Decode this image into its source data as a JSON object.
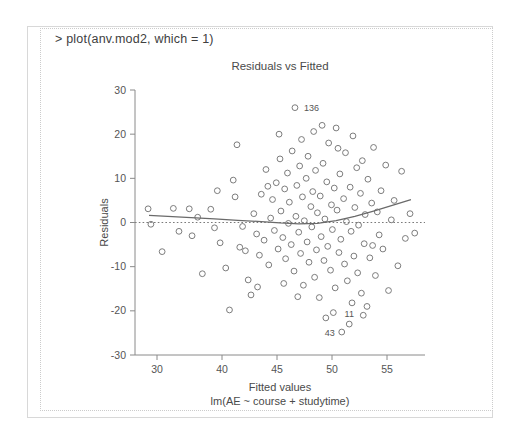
{
  "console": {
    "prompt_line": "> plot(anv.mod2, which = 1)"
  },
  "chart_data": {
    "type": "scatter",
    "title": "Residuals vs Fitted",
    "xlabel": "Fitted values",
    "sublabel": "lm(AE ~ course + studytime)",
    "ylabel": "Residuals",
    "xlim": [
      27.5,
      58.5
    ],
    "ylim": [
      -30,
      30
    ],
    "xticks": [
      30,
      40,
      45,
      50,
      55
    ],
    "xtick_labels": [
      "30",
      "40",
      "45",
      "50",
      "55"
    ],
    "yticks": [
      30,
      20,
      10,
      0,
      -10,
      -20,
      -30
    ],
    "ytick_labels": [
      "30",
      "20",
      "10",
      "0",
      "-10",
      "-20",
      "-30"
    ],
    "grid": false,
    "legend": "none",
    "reference_line": {
      "type": "horizontal-dotted",
      "y": 0
    },
    "smoother": {
      "type": "loess",
      "x": [
        29.0,
        31.0,
        33.5,
        36.0,
        38.5,
        41.0,
        43.0,
        45.0,
        47.0,
        49.0,
        51.0,
        53.0,
        55.0,
        57.0
      ],
      "y": [
        1.6,
        1.4,
        1.1,
        0.8,
        0.5,
        0.2,
        -0.1,
        -0.3,
        -0.2,
        0.4,
        1.4,
        2.6,
        3.9,
        5.2
      ]
    },
    "annotations": [
      {
        "label": "136",
        "x": 44.6,
        "y": 26.0
      },
      {
        "label": "11",
        "x": 50.4,
        "y": -23.0
      },
      {
        "label": "43",
        "x": 49.6,
        "y": -24.8
      }
    ],
    "points": [
      {
        "x": 28.9,
        "y": 3.1
      },
      {
        "x": 29.2,
        "y": -0.4
      },
      {
        "x": 30.4,
        "y": -6.6
      },
      {
        "x": 31.6,
        "y": 3.2
      },
      {
        "x": 33.3,
        "y": 3.1
      },
      {
        "x": 33.6,
        "y": -3.0
      },
      {
        "x": 34.7,
        "y": -11.6
      },
      {
        "x": 35.6,
        "y": 3.0
      },
      {
        "x": 36.0,
        "y": -1.2
      },
      {
        "x": 36.6,
        "y": -4.6
      },
      {
        "x": 37.2,
        "y": -10.3
      },
      {
        "x": 37.6,
        "y": -19.8
      },
      {
        "x": 38.0,
        "y": 9.6
      },
      {
        "x": 38.4,
        "y": 17.6
      },
      {
        "x": 38.7,
        "y": -5.6
      },
      {
        "x": 39.0,
        "y": -0.9
      },
      {
        "x": 39.3,
        "y": -6.4
      },
      {
        "x": 39.6,
        "y": -13.0
      },
      {
        "x": 39.9,
        "y": -16.4
      },
      {
        "x": 40.2,
        "y": 2.0
      },
      {
        "x": 40.5,
        "y": -2.6
      },
      {
        "x": 40.8,
        "y": -7.4
      },
      {
        "x": 41.0,
        "y": 6.4
      },
      {
        "x": 41.3,
        "y": -4.0
      },
      {
        "x": 41.5,
        "y": 12.0
      },
      {
        "x": 41.8,
        "y": -9.6
      },
      {
        "x": 42.0,
        "y": 1.0
      },
      {
        "x": 42.2,
        "y": 5.2
      },
      {
        "x": 42.4,
        "y": -1.8
      },
      {
        "x": 42.6,
        "y": 9.0
      },
      {
        "x": 42.8,
        "y": -6.0
      },
      {
        "x": 43.0,
        "y": 14.4
      },
      {
        "x": 43.1,
        "y": 2.6
      },
      {
        "x": 43.3,
        "y": -3.4
      },
      {
        "x": 43.5,
        "y": 7.6
      },
      {
        "x": 43.6,
        "y": -8.2
      },
      {
        "x": 43.8,
        "y": 11.2
      },
      {
        "x": 43.9,
        "y": -0.2
      },
      {
        "x": 44.0,
        "y": 4.6
      },
      {
        "x": 44.2,
        "y": -5.0
      },
      {
        "x": 44.3,
        "y": 16.2
      },
      {
        "x": 44.5,
        "y": -11.0
      },
      {
        "x": 44.6,
        "y": 26.0
      },
      {
        "x": 44.7,
        "y": 1.4
      },
      {
        "x": 44.8,
        "y": 8.4
      },
      {
        "x": 45.0,
        "y": -2.2
      },
      {
        "x": 45.1,
        "y": 12.8
      },
      {
        "x": 45.2,
        "y": -7.0
      },
      {
        "x": 45.4,
        "y": 5.8
      },
      {
        "x": 45.5,
        "y": -14.2
      },
      {
        "x": 45.6,
        "y": 0.4
      },
      {
        "x": 45.8,
        "y": 10.0
      },
      {
        "x": 45.9,
        "y": -4.4
      },
      {
        "x": 46.0,
        "y": 15.0
      },
      {
        "x": 46.1,
        "y": -9.0
      },
      {
        "x": 46.3,
        "y": 3.6
      },
      {
        "x": 46.4,
        "y": -1.0
      },
      {
        "x": 46.5,
        "y": 7.0
      },
      {
        "x": 46.7,
        "y": -12.4
      },
      {
        "x": 46.8,
        "y": 11.8
      },
      {
        "x": 46.9,
        "y": -6.2
      },
      {
        "x": 47.0,
        "y": 2.2
      },
      {
        "x": 47.2,
        "y": -17.0
      },
      {
        "x": 47.3,
        "y": 6.0
      },
      {
        "x": 47.4,
        "y": -3.2
      },
      {
        "x": 47.6,
        "y": 13.4
      },
      {
        "x": 47.7,
        "y": -8.6
      },
      {
        "x": 47.8,
        "y": 0.8
      },
      {
        "x": 48.0,
        "y": 9.2
      },
      {
        "x": 48.1,
        "y": -5.4
      },
      {
        "x": 48.2,
        "y": 18.0
      },
      {
        "x": 48.4,
        "y": -10.8
      },
      {
        "x": 48.5,
        "y": 4.0
      },
      {
        "x": 48.6,
        "y": -1.6
      },
      {
        "x": 48.8,
        "y": 7.8
      },
      {
        "x": 48.9,
        "y": -14.8
      },
      {
        "x": 49.0,
        "y": 21.4
      },
      {
        "x": 49.1,
        "y": 2.8
      },
      {
        "x": 49.3,
        "y": -6.8
      },
      {
        "x": 49.4,
        "y": 11.0
      },
      {
        "x": 49.5,
        "y": -3.8
      },
      {
        "x": 49.6,
        "y": -24.8
      },
      {
        "x": 49.8,
        "y": 5.4
      },
      {
        "x": 49.9,
        "y": -9.4
      },
      {
        "x": 50.0,
        "y": 15.8
      },
      {
        "x": 50.1,
        "y": 0.2
      },
      {
        "x": 50.2,
        "y": -13.2
      },
      {
        "x": 50.4,
        "y": -23.0
      },
      {
        "x": 50.5,
        "y": 8.0
      },
      {
        "x": 50.6,
        "y": -2.0
      },
      {
        "x": 50.8,
        "y": 19.6
      },
      {
        "x": 50.9,
        "y": -7.6
      },
      {
        "x": 51.0,
        "y": 3.4
      },
      {
        "x": 51.2,
        "y": 12.4
      },
      {
        "x": 51.3,
        "y": -11.4
      },
      {
        "x": 51.4,
        "y": -0.6
      },
      {
        "x": 51.6,
        "y": 6.6
      },
      {
        "x": 51.7,
        "y": -16.0
      },
      {
        "x": 51.8,
        "y": 14.0
      },
      {
        "x": 52.0,
        "y": -4.8
      },
      {
        "x": 52.1,
        "y": 1.8
      },
      {
        "x": 52.3,
        "y": -19.0
      },
      {
        "x": 52.4,
        "y": 9.8
      },
      {
        "x": 52.6,
        "y": -8.0
      },
      {
        "x": 52.8,
        "y": 4.4
      },
      {
        "x": 53.0,
        "y": 17.0
      },
      {
        "x": 53.2,
        "y": -12.0
      },
      {
        "x": 53.4,
        "y": 2.4
      },
      {
        "x": 53.6,
        "y": -2.8
      },
      {
        "x": 53.8,
        "y": 7.2
      },
      {
        "x": 54.0,
        "y": -6.0
      },
      {
        "x": 54.3,
        "y": 13.0
      },
      {
        "x": 54.6,
        "y": -15.4
      },
      {
        "x": 54.9,
        "y": 0.6
      },
      {
        "x": 55.2,
        "y": 5.0
      },
      {
        "x": 55.6,
        "y": -9.8
      },
      {
        "x": 56.0,
        "y": 11.6
      },
      {
        "x": 56.4,
        "y": -3.6
      },
      {
        "x": 56.9,
        "y": 2.0
      },
      {
        "x": 57.4,
        "y": -2.4
      },
      {
        "x": 42.9,
        "y": 20.0
      },
      {
        "x": 41.7,
        "y": 8.2
      },
      {
        "x": 44.9,
        "y": -16.8
      },
      {
        "x": 46.6,
        "y": 20.6
      },
      {
        "x": 48.7,
        "y": -20.4
      },
      {
        "x": 50.7,
        "y": -18.2
      },
      {
        "x": 43.4,
        "y": -13.8
      },
      {
        "x": 47.9,
        "y": -21.6
      },
      {
        "x": 45.3,
        "y": 18.8
      },
      {
        "x": 40.6,
        "y": -14.6
      },
      {
        "x": 38.2,
        "y": 5.8
      },
      {
        "x": 36.3,
        "y": 7.2
      },
      {
        "x": 34.2,
        "y": 1.2
      },
      {
        "x": 32.2,
        "y": -2.0
      },
      {
        "x": 51.9,
        "y": -21.0
      },
      {
        "x": 49.2,
        "y": 16.8
      },
      {
        "x": 52.9,
        "y": -5.2
      },
      {
        "x": 47.5,
        "y": 22.0
      }
    ]
  }
}
